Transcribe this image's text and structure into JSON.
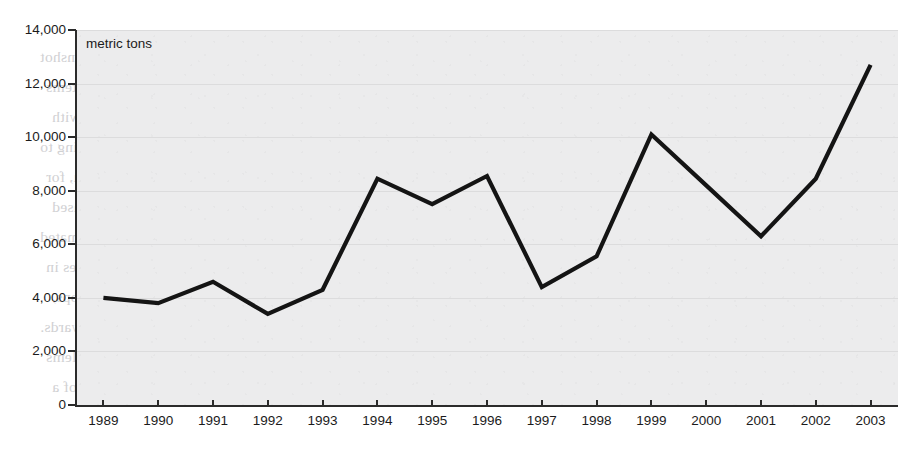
{
  "chart_data": {
    "type": "line",
    "title": "",
    "subtitle": "",
    "xlabel": "",
    "ylabel": "",
    "unit_label": "metric tons",
    "grid": true,
    "legend": "none",
    "xlim": [
      1989,
      2003
    ],
    "ylim": [
      0,
      14000
    ],
    "y_ticks": [
      "0",
      "2,000",
      "4,000",
      "6,000",
      "8,000",
      "10,000",
      "12,000",
      "14,000"
    ],
    "y_tick_values": [
      0,
      2000,
      4000,
      6000,
      8000,
      10000,
      12000,
      14000
    ],
    "categories": [
      "1989",
      "1990",
      "1991",
      "1992",
      "1993",
      "1994",
      "1995",
      "1996",
      "1997",
      "1998",
      "1999",
      "2000",
      "2001",
      "2002",
      "2003"
    ],
    "values": [
      4000,
      3800,
      4600,
      3400,
      4300,
      8450,
      7500,
      8550,
      4400,
      5550,
      10100,
      8200,
      6300,
      8450,
      12700
    ],
    "series": [
      {
        "name": "production",
        "values": [
          4000,
          3800,
          4600,
          3400,
          4300,
          8450,
          7500,
          8550,
          4400,
          5550,
          10100,
          8200,
          6300,
          8450,
          12700
        ]
      }
    ],
    "colors": {
      "line": "#141414",
      "plot_background": "#ececed",
      "gridline": "#dcdcdd",
      "axis": "#2b2b2b",
      "text": "#1b1b1b"
    }
  },
  "background_text": {
    "note": "faint bleed-through from reverse of scanned page (mirrored, partially legible)",
    "lines": [
      "lead from production (Global 2003). A large proportion of the gunshot",
      "fisheries have the potential to affect a range of continents and ecosystems",
      "in the US. From the mid-1980s, however, this point on changes and with",
      "constitutes an important element of sound, to be used considerable grazing to",
      "a species in Indian Ocean, especially in the 1970s. Argentine and Peru, for",
      "meant for the species to the water supply production is related to the increased",
      "part of algae on the marine ecosystem. These results have been estimated",
      "that, while upstream reservoirs may occur in the waterways, changes in",
      "crop production increased from 3,014 tons in the region to the major crops,",
      "1993 to the 1990s onwards.",
      "The abundance of suitable reef is a different picture of the long term problems",
      "involved. Based on the existing management of the reef as a proportion of a"
    ]
  }
}
